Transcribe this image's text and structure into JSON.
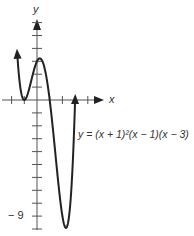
{
  "graph": {
    "y_axis_label": "y",
    "x_axis_label": "x",
    "equation": "y = (x + 1)²(x − 1)(x − 3)",
    "y_tick_label": "− 9",
    "origin_px": [
      37,
      100
    ],
    "x_unit_px": 12.7,
    "y_unit_px": 12.9,
    "x_ticks": [
      -2,
      -1,
      1,
      2,
      3,
      4
    ],
    "y_ticks": [
      -10,
      -9,
      -8,
      -7,
      -6,
      -5,
      -4,
      -3,
      -2,
      -1,
      1,
      2,
      3,
      4,
      5,
      6
    ],
    "x_domain": [
      -1.55,
      3.0
    ],
    "curve_color": "#222222",
    "axis_color": "#555555"
  }
}
